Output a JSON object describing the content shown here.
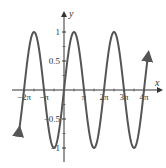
{
  "chart_data": {
    "type": "line",
    "title": "",
    "function": "y = sin(x)",
    "xlabel": "x",
    "ylabel": "y",
    "xlim": [
      -2.3,
      4.25
    ],
    "ylim": [
      -1.15,
      1.25
    ],
    "x_unit": "pi",
    "x_ticks": [
      {
        "value": -2,
        "label": "−2π"
      },
      {
        "value": -1,
        "label": "−π"
      },
      {
        "value": 1,
        "label": "π"
      },
      {
        "value": 2,
        "label": "2π"
      },
      {
        "value": 3,
        "label": "3π"
      },
      {
        "value": 4,
        "label": "4π"
      }
    ],
    "y_ticks": [
      {
        "value": 1,
        "label": "1"
      },
      {
        "value": 0.5,
        "label": "0.5"
      },
      {
        "value": -0.5,
        "label": "−0.5"
      },
      {
        "value": -1,
        "label": "−1"
      }
    ],
    "series": [
      {
        "name": "sin(x)",
        "color": "#555555",
        "x_pi": [
          -2.25,
          -2,
          -1.5,
          -1,
          -0.5,
          0,
          0.5,
          1,
          1.5,
          2,
          2.5,
          3,
          3.5,
          4,
          4.2
        ],
        "y": [
          -0.71,
          0,
          1,
          0,
          -1,
          0,
          1,
          0,
          -1,
          0,
          1,
          0,
          -1,
          0,
          0.59
        ]
      }
    ],
    "grid": false,
    "legend": null,
    "arrows": {
      "curve_left": "down",
      "curve_right": "up",
      "x_axis": "right",
      "y_axis": "up"
    }
  }
}
